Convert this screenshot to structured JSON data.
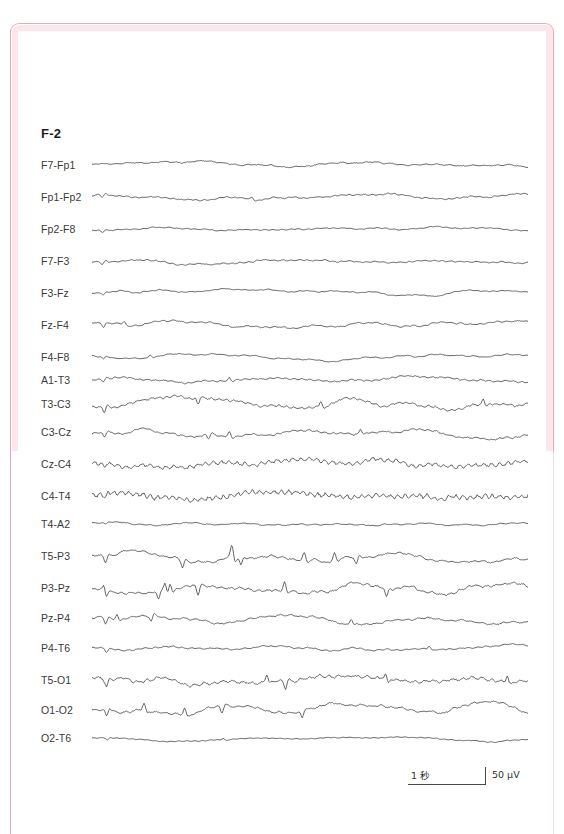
{
  "document": {
    "frame_color": "#eda8b6",
    "frame_glow_color": "#fbe6eb",
    "background": "#ffffff",
    "trace_color": "#4a4a4a"
  },
  "header": {
    "montage_title": "F-2"
  },
  "scalebar": {
    "time_label": "1 秒",
    "amplitude_label": "50 μV"
  },
  "chart_data": {
    "type": "line",
    "title": "F-2",
    "xlabel": "",
    "ylabel": "",
    "recording_type": "EEG multi-channel bipolar montage",
    "channel_count": 20,
    "time_scale_seconds_per_division": 1,
    "amplitude_scale_microvolts": 50,
    "row_spacing_px": 32,
    "trace_start_x": 92,
    "trace_end_x": 528,
    "first_trace_y": 165,
    "categories": [
      "F7-Fp1",
      "Fp1-Fp2",
      "Fp2-F8",
      "F7-F3",
      "F3-Fz",
      "Fz-F4",
      "F4-F8",
      "A1-T3",
      "T3-C3",
      "C3-Cz",
      "Cz-C4",
      "C4-T4",
      "T4-A2",
      "T5-P3",
      "P3-Pz",
      "Pz-P4",
      "P4-T6",
      "T5-O1",
      "O1-O2",
      "O2-T6"
    ],
    "series": [
      {
        "name": "F7-Fp1",
        "label": "F7-Fp1",
        "y": 165,
        "amplitude": 4.5,
        "roughness": 1.4,
        "seed": 11,
        "slow": 2.0,
        "spikes": 0
      },
      {
        "name": "Fp1-Fp2",
        "label": "Fp1-Fp2",
        "y": 197,
        "amplitude": 4.0,
        "roughness": 1.2,
        "seed": 23,
        "slow": 3.0,
        "spikes": 2
      },
      {
        "name": "Fp2-F8",
        "label": "Fp2-F8",
        "y": 229,
        "amplitude": 3.5,
        "roughness": 1.1,
        "seed": 37,
        "slow": 2.0,
        "spikes": 1
      },
      {
        "name": "F7-F3",
        "label": "F7-F3",
        "y": 261,
        "amplitude": 4.5,
        "roughness": 1.5,
        "seed": 41,
        "slow": 2.2,
        "spikes": 1
      },
      {
        "name": "F3-Fz",
        "label": "F3-Fz",
        "y": 293,
        "amplitude": 4.5,
        "roughness": 1.2,
        "seed": 53,
        "slow": 3.4,
        "spikes": 1
      },
      {
        "name": "Fz-F4",
        "label": "Fz-F4",
        "y": 325,
        "amplitude": 5.0,
        "roughness": 1.5,
        "seed": 67,
        "slow": 3.6,
        "spikes": 2
      },
      {
        "name": "F4-F8",
        "label": "F4-F8",
        "y": 357,
        "amplitude": 5.0,
        "roughness": 1.4,
        "seed": 71,
        "slow": 3.2,
        "spikes": 2
      },
      {
        "name": "A1-T3",
        "label": "A1-T3",
        "y": 380,
        "amplitude": 4.5,
        "roughness": 2.0,
        "seed": 83,
        "slow": 2.2,
        "spikes": 2
      },
      {
        "name": "T3-C3",
        "label": "T3-C3",
        "y": 404,
        "amplitude": 9.0,
        "roughness": 2.2,
        "seed": 97,
        "slow": 4.0,
        "spikes": 4
      },
      {
        "name": "C3-Cz",
        "label": "C3-Cz",
        "y": 432,
        "amplitude": 8.0,
        "roughness": 2.0,
        "seed": 103,
        "slow": 4.0,
        "spikes": 4
      },
      {
        "name": "Cz-C4",
        "label": "Cz-C4",
        "y": 464,
        "amplitude": 6.5,
        "roughness": 5.2,
        "seed": 113,
        "slow": 3.6,
        "spikes": 1
      },
      {
        "name": "C4-T4",
        "label": "C4-T4",
        "y": 496,
        "amplitude": 6.5,
        "roughness": 5.6,
        "seed": 127,
        "slow": 3.4,
        "spikes": 1
      },
      {
        "name": "T4-A2",
        "label": "T4-A2",
        "y": 524,
        "amplitude": 2.4,
        "roughness": 1.0,
        "seed": 131,
        "slow": 1.4,
        "spikes": 1
      },
      {
        "name": "T5-P3",
        "label": "T5-P3",
        "y": 556,
        "amplitude": 12.0,
        "roughness": 2.6,
        "seed": 149,
        "slow": 5.0,
        "spikes": 8
      },
      {
        "name": "P3-Pz",
        "label": "P3-Pz",
        "y": 588,
        "amplitude": 11.0,
        "roughness": 2.4,
        "seed": 157,
        "slow": 4.6,
        "spikes": 8
      },
      {
        "name": "Pz-P4",
        "label": "Pz-P4",
        "y": 618,
        "amplitude": 7.0,
        "roughness": 1.8,
        "seed": 167,
        "slow": 3.6,
        "spikes": 4
      },
      {
        "name": "P4-T6",
        "label": "P4-T6",
        "y": 648,
        "amplitude": 4.5,
        "roughness": 1.4,
        "seed": 179,
        "slow": 2.4,
        "spikes": 2
      },
      {
        "name": "T5-O1",
        "label": "T5-O1",
        "y": 680,
        "amplitude": 9.5,
        "roughness": 3.0,
        "seed": 191,
        "slow": 4.2,
        "spikes": 6
      },
      {
        "name": "O1-O2",
        "label": "O1-O2",
        "y": 710,
        "amplitude": 9.0,
        "roughness": 2.2,
        "seed": 199,
        "slow": 4.0,
        "spikes": 5
      },
      {
        "name": "O2-T6",
        "label": "O2-T6",
        "y": 738,
        "amplitude": 4.5,
        "roughness": 1.4,
        "seed": 211,
        "slow": 2.2,
        "spikes": 2
      }
    ]
  }
}
